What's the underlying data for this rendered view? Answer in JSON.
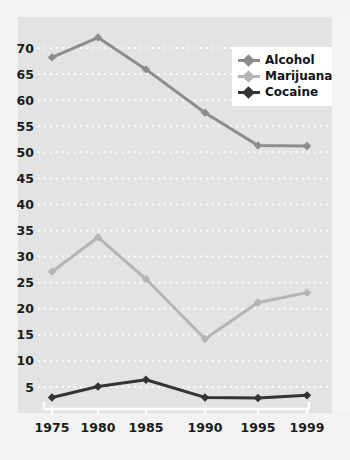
{
  "chart_data": {
    "type": "line",
    "title": "",
    "subtitle": "",
    "xlabel": "",
    "ylabel": "",
    "x": [
      "1975",
      "1980",
      "1985",
      "1990",
      "1995",
      "1999"
    ],
    "categories": [
      "1975",
      "1980",
      "1985",
      "1990",
      "1995",
      "1999"
    ],
    "xtick_labels": [
      "1975",
      "1980",
      "1985",
      "1990",
      "1995",
      "1999"
    ],
    "ytick_labels": [
      "70",
      "65",
      "60",
      "55",
      "50",
      "45",
      "40",
      "35",
      "30",
      "25",
      "20",
      "15",
      "10",
      "5"
    ],
    "ytick_values": [
      70,
      65,
      60,
      55,
      50,
      45,
      40,
      35,
      30,
      25,
      20,
      15,
      10,
      5
    ],
    "ylim": [
      0,
      74
    ],
    "grid": "horizontal-dotted-white",
    "legend_position": "top-right",
    "series": [
      {
        "name": "Alcohol",
        "color": "#8c8c8c",
        "values": [
          68.2,
          72.0,
          65.9,
          57.6,
          51.3,
          51.2
        ]
      },
      {
        "name": "Marijuana",
        "color": "#b5b5b5",
        "values": [
          27.1,
          33.7,
          25.7,
          14.2,
          21.2,
          23.1
        ]
      },
      {
        "name": "Cocaine",
        "color": "#333333",
        "values": [
          3.0,
          5.1,
          6.4,
          3.0,
          2.9,
          3.4
        ]
      }
    ]
  },
  "legend": {
    "items": [
      {
        "label": "Alcohol",
        "color": "#8c8c8c"
      },
      {
        "label": "Marijuana",
        "color": "#b5b5b5"
      },
      {
        "label": "Cocaine",
        "color": "#333333"
      }
    ]
  },
  "colors": {
    "alcohol": "#8c8c8c",
    "marijuana": "#b5b5b5",
    "cocaine": "#333333",
    "panel": "#e3e3e3",
    "gridline": "#ffffff",
    "axis": "#ffffff",
    "tick_text": "#1b1b1b"
  }
}
